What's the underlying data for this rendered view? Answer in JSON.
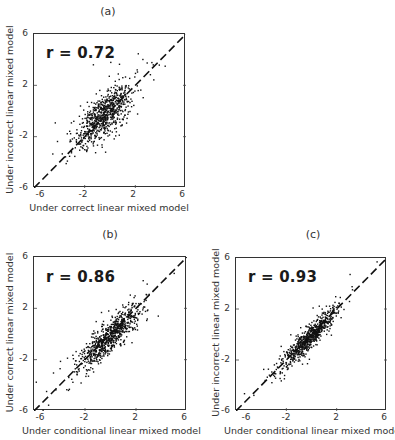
{
  "chart_data": [
    {
      "type": "scatter",
      "panel": "(a)",
      "title": "(a)",
      "annotation": "r = 0.72",
      "r": 0.72,
      "xlabel": "Under correct linear mixed model",
      "ylabel": "Under incorrect linear mixed model",
      "xlim": [
        -6,
        6
      ],
      "ylim": [
        -6,
        6
      ],
      "xticks": [
        "-6",
        "-2",
        "2",
        "6"
      ],
      "yticks": [
        "6",
        "2",
        "-2",
        "-6"
      ],
      "reference_line": "y = x (dashed)",
      "grid": false,
      "n_points": 750,
      "cloud": {
        "center": [
          -0.4,
          -0.3
        ],
        "sd_x": 1.1,
        "sd_y": 1.15,
        "corr": 0.72,
        "seed": 11
      }
    },
    {
      "type": "scatter",
      "panel": "(b)",
      "title": "(b)",
      "annotation": "r = 0.86",
      "r": 0.86,
      "xlabel": "Under conditional linear mixed model",
      "ylabel": "Under correct linear mixed model",
      "xlim": [
        -6,
        6
      ],
      "ylim": [
        -6,
        6
      ],
      "xticks": [
        "-6",
        "-2",
        "2",
        "6"
      ],
      "yticks": [
        "6",
        "2",
        "-2",
        "-6"
      ],
      "reference_line": "y = x (dashed)",
      "grid": false,
      "n_points": 750,
      "cloud": {
        "center": [
          -0.1,
          -0.3
        ],
        "sd_x": 1.15,
        "sd_y": 1.2,
        "corr": 0.86,
        "seed": 23
      }
    },
    {
      "type": "scatter",
      "panel": "(c)",
      "title": "(c)",
      "annotation": "r = 0.93",
      "r": 0.93,
      "xlabel": "Under conditional linear mixed model",
      "ylabel": "Under incorrect linear mixed model",
      "xlim": [
        -6,
        6
      ],
      "ylim": [
        -6,
        6
      ],
      "xticks": [
        "-6",
        "-2",
        "2",
        "6"
      ],
      "yticks": [
        "6",
        "2",
        "-2",
        "-6"
      ],
      "reference_line": "y = x (dashed)",
      "grid": false,
      "n_points": 750,
      "cloud": {
        "center": [
          -0.1,
          -0.2
        ],
        "sd_x": 1.1,
        "sd_y": 1.15,
        "corr": 0.93,
        "seed": 37
      }
    }
  ],
  "panels": {
    "a": {
      "label": "(a)",
      "r_text": "r = 0.72",
      "xlabel": "Under correct linear mixed model",
      "ylabel": "Under incorrect linear mixed model"
    },
    "b": {
      "label": "(b)",
      "r_text": "r = 0.86",
      "xlabel": "Under conditional linear mixed model",
      "ylabel": "Under correct linear mixed model"
    },
    "c": {
      "label": "(c)",
      "r_text": "r = 0.93",
      "xlabel": "Under conditional linear mixed model",
      "ylabel": "Under incorrect linear mixed model"
    }
  },
  "ticks": {
    "x": [
      "-6",
      "-2",
      "2",
      "6"
    ],
    "y": [
      "6",
      "2",
      "-2",
      "-6"
    ]
  }
}
